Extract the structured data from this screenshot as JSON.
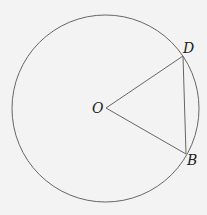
{
  "diagram": {
    "type": "geometry",
    "circle": {
      "cx": 105.5,
      "cy": 108.5,
      "r": 93.5,
      "stroke": "#666666"
    },
    "points": {
      "O": {
        "label": "O",
        "x": 106,
        "y": 108
      },
      "D": {
        "label": "D",
        "x": 183,
        "y": 56
      },
      "B": {
        "label": "B",
        "x": 186,
        "y": 154
      }
    },
    "segments": [
      [
        "O",
        "D"
      ],
      [
        "O",
        "B"
      ],
      [
        "D",
        "B"
      ]
    ],
    "background": "#f3f3f3",
    "line_color": "#666666"
  }
}
